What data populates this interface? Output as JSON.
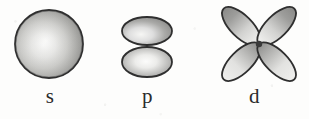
{
  "figure": {
    "background_color": "#fdfdfc",
    "ink_color": "#2b2b2b",
    "width": 309,
    "height": 119
  },
  "orbitals": [
    {
      "key": "s",
      "label": "s",
      "shape": "sphere",
      "lobe_count": 1,
      "icon": "s-orbital-sphere-icon",
      "outline_color": "#333333",
      "fill_light": "#f2f2f0",
      "fill_dark": "#8f8f8f",
      "center_x": 49,
      "center_y": 44,
      "radius": 34
    },
    {
      "key": "p",
      "label": "p",
      "shape": "dumbbell",
      "lobe_count": 2,
      "icon": "p-orbital-dumbbell-icon",
      "outline_color": "#333333",
      "fill_light": "#f4f4f2",
      "fill_dark": "#8a8a8a",
      "center_x": 47,
      "center_y": 44,
      "lobe_width": 50,
      "lobe_height": 30
    },
    {
      "key": "d",
      "label": "d",
      "shape": "cloverleaf",
      "lobe_count": 4,
      "icon": "d-orbital-cloverleaf-icon",
      "outline_color": "#333333",
      "fill_light": "#f2f2f0",
      "fill_dark": "#878787",
      "center_x": 59,
      "center_y": 44,
      "lobe_length": 48,
      "lobe_width": 21,
      "lobe_angles_deg": [
        45,
        135,
        225,
        315
      ]
    }
  ]
}
